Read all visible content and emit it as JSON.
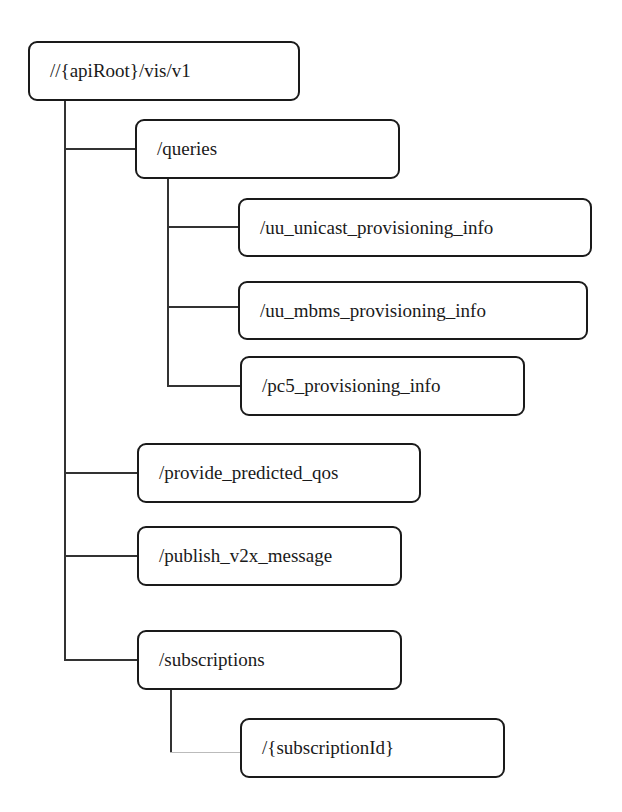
{
  "diagram": {
    "root": {
      "label": "//{apiRoot}/vis/v1"
    },
    "nodes": [
      {
        "id": "queries",
        "label": "/queries",
        "parent": "root"
      },
      {
        "id": "uu_unicast",
        "label": "/uu_unicast_provisioning_info",
        "parent": "queries"
      },
      {
        "id": "uu_mbms",
        "label": "/uu_mbms_provisioning_info",
        "parent": "queries"
      },
      {
        "id": "pc5",
        "label": "/pc5_provisioning_info",
        "parent": "queries"
      },
      {
        "id": "provide_qos",
        "label": "/provide_predicted_qos",
        "parent": "root"
      },
      {
        "id": "publish_v2x",
        "label": "/publish_v2x_message",
        "parent": "root"
      },
      {
        "id": "subscriptions",
        "label": "/subscriptions",
        "parent": "root"
      },
      {
        "id": "subscription_id",
        "label": "/{subscriptionId}",
        "parent": "subscriptions"
      }
    ],
    "colors": {
      "stroke": "#1a1a1a",
      "background": "#ffffff"
    }
  }
}
